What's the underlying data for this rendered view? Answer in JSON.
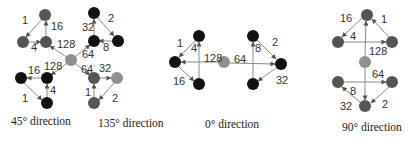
{
  "colors": {
    "black": "#111111",
    "dark_gray": "#555555",
    "gray": "#8f8f8f",
    "edge": "#8a8a8a"
  },
  "panels": [
    {
      "id": "diag45_135",
      "captions": [
        "45° direction",
        "135° direction"
      ],
      "center_node": {
        "x": 71,
        "y": 60,
        "shade": "gray"
      },
      "nodes": [
        {
          "id": "a1",
          "x": 45,
          "y": 15,
          "shade": "dark_gray"
        },
        {
          "id": "a2",
          "x": 23,
          "y": 42,
          "shade": "dark_gray"
        },
        {
          "id": "a3",
          "x": 46,
          "y": 42,
          "shade": "dark_gray"
        },
        {
          "id": "b1",
          "x": 94,
          "y": 13,
          "shade": "black"
        },
        {
          "id": "b2",
          "x": 94,
          "y": 41,
          "shade": "black"
        },
        {
          "id": "b3",
          "x": 118,
          "y": 41,
          "shade": "black"
        },
        {
          "id": "c1",
          "x": 21,
          "y": 78,
          "shade": "black"
        },
        {
          "id": "c2",
          "x": 47,
          "y": 78,
          "shade": "black"
        },
        {
          "id": "c3",
          "x": 47,
          "y": 103,
          "shade": "black"
        },
        {
          "id": "d1",
          "x": 94,
          "y": 78,
          "shade": "dark_gray"
        },
        {
          "id": "d2",
          "x": 117,
          "y": 78,
          "shade": "gray"
        },
        {
          "id": "d3",
          "x": 94,
          "y": 103,
          "shade": "dark_gray"
        }
      ],
      "edge_labels": [
        "1",
        "16",
        "4",
        "128",
        "32",
        "2",
        "64",
        "8",
        "16",
        "128",
        "4",
        "1",
        "64",
        "32",
        "1",
        "2"
      ]
    },
    {
      "id": "diag0",
      "captions": [
        "0° direction"
      ],
      "edge_labels": [
        "1",
        "4",
        "128",
        "64",
        "8",
        "2",
        "16",
        "32"
      ]
    },
    {
      "id": "diag90",
      "captions": [
        "90° direction"
      ],
      "edge_labels": [
        "16",
        "1",
        "4",
        "128",
        "64",
        "8",
        "32",
        "2"
      ]
    }
  ],
  "labels": {
    "l45_1": "1",
    "l45_16": "16",
    "l45_4": "4",
    "l45_128": "128",
    "l135_32": "32",
    "l135_2": "2",
    "l135_64": "64",
    "l135_8": "8",
    "l45b_16": "16",
    "l45b_128": "128",
    "l45b_4": "4",
    "l45b_1": "1",
    "l135b_64": "64",
    "l135b_32": "32",
    "l135b_1": "1",
    "l135b_2": "2",
    "l0_1": "1",
    "l0_4": "4",
    "l0_128": "128",
    "l0_64": "64",
    "l0_8": "8",
    "l0_2": "2",
    "l0_16": "16",
    "l0_32": "32",
    "l90_16": "16",
    "l90_1": "1",
    "l90_4": "4",
    "l90_128": "128",
    "l90_64": "64",
    "l90_8": "8",
    "l90_32": "32",
    "l90_2": "2"
  },
  "captions": {
    "c45": "45° direction",
    "c135": "135° direction",
    "c0": "0° direction",
    "c90": "90° direction"
  }
}
